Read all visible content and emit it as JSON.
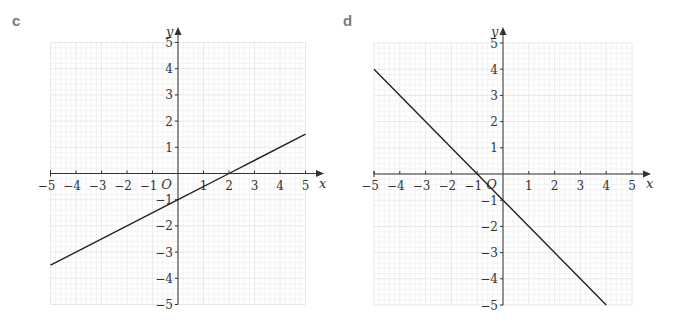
{
  "chart_data": [
    {
      "type": "line",
      "panel_label": "c",
      "title": "",
      "xlabel": "x",
      "ylabel": "y",
      "origin_label": "O",
      "xlim": [
        -5,
        5
      ],
      "ylim": [
        -5,
        5
      ],
      "x_ticks": [
        -5,
        -4,
        -3,
        -2,
        -1,
        1,
        2,
        3,
        4,
        5
      ],
      "y_ticks": [
        -5,
        -4,
        -3,
        -2,
        -1,
        1,
        2,
        3,
        4,
        5
      ],
      "grid": true,
      "series": [
        {
          "name": "y = 0.5x - 1",
          "x": [
            -5,
            0,
            2,
            5
          ],
          "y": [
            -3.5,
            -1,
            0,
            1.5
          ]
        }
      ]
    },
    {
      "type": "line",
      "panel_label": "d",
      "title": "",
      "xlabel": "x",
      "ylabel": "y",
      "origin_label": "O",
      "xlim": [
        -5,
        5
      ],
      "ylim": [
        -5,
        5
      ],
      "x_ticks": [
        -5,
        -4,
        -3,
        -2,
        -1,
        1,
        2,
        3,
        4,
        5
      ],
      "y_ticks": [
        -5,
        -4,
        -3,
        -2,
        -1,
        1,
        2,
        3,
        4,
        5
      ],
      "grid": true,
      "series": [
        {
          "name": "y = -x - 1",
          "x": [
            -5,
            -1,
            0,
            4
          ],
          "y": [
            4,
            0,
            -1,
            -5
          ]
        }
      ]
    }
  ],
  "colors": {
    "axis": "#333333",
    "line": "#222222",
    "grid_minor": "#f0f0f0",
    "grid_major": "#e2e2e2",
    "panel_label": "#7a7a7a"
  }
}
